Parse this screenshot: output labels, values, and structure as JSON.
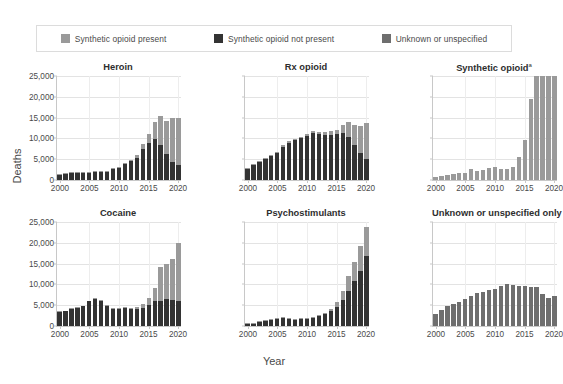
{
  "legend": {
    "items": [
      {
        "label": "Synthetic opioid present",
        "color": "#9a9a9a",
        "key": "present"
      },
      {
        "label": "Synthetic opioid not present",
        "color": "#333333",
        "key": "not_present"
      },
      {
        "label": "Unknown or unspecified",
        "color": "#6e6e6e",
        "key": "unknown"
      }
    ]
  },
  "axes": {
    "xlabel": "Year",
    "ylabel": "Deaths",
    "yticks": [
      "0",
      "5,000",
      "10,000",
      "15,000",
      "20,000",
      "25,000"
    ],
    "ytick_values": [
      0,
      5000,
      10000,
      15000,
      20000,
      25000
    ],
    "ylim": [
      0,
      25000
    ],
    "xticks": [
      "2000",
      "2005",
      "2010",
      "2015",
      "2020"
    ],
    "xtick_values": [
      2000,
      2005,
      2010,
      2015,
      2020
    ],
    "xlim": [
      2000,
      2020
    ]
  },
  "chart_data": {
    "type": "bar",
    "title": "",
    "xlabel": "Year",
    "ylabel": "Deaths",
    "ylim": [
      0,
      25000
    ],
    "grid": "horizontal-and-vertical",
    "legend_position": "top",
    "stacked": true,
    "x": [
      2000,
      2001,
      2002,
      2003,
      2004,
      2005,
      2006,
      2007,
      2008,
      2009,
      2010,
      2011,
      2012,
      2013,
      2014,
      2015,
      2016,
      2017,
      2018,
      2019,
      2020
    ],
    "panels": [
      {
        "title": "Heroin",
        "title_superscript": "",
        "series": [
          {
            "name": "Synthetic opioid not present",
            "key": "not_present",
            "color": "#333333",
            "values": [
              1300,
              1500,
              1700,
              1800,
              1700,
              1800,
              1900,
              1900,
              2000,
              2600,
              2800,
              3800,
              4500,
              5400,
              7400,
              9000,
              9800,
              8500,
              6200,
              4400,
              3500
            ]
          },
          {
            "name": "Synthetic opioid present",
            "key": "present",
            "color": "#9a9a9a",
            "values": [
              50,
              60,
              70,
              80,
              80,
              90,
              120,
              110,
              120,
              140,
              170,
              250,
              400,
              700,
              1200,
              2000,
              4200,
              7000,
              8000,
              10600,
              11300
            ]
          }
        ]
      },
      {
        "title": "Rx opioid",
        "title_superscript": "",
        "series": [
          {
            "name": "Synthetic opioid not present",
            "key": "not_present",
            "color": "#333333",
            "values": [
              2700,
              3600,
              4400,
              5100,
              5800,
              6400,
              8000,
              9000,
              9500,
              10000,
              10500,
              11200,
              11000,
              10800,
              10800,
              11000,
              11400,
              10400,
              8400,
              6400,
              5000
            ]
          },
          {
            "name": "Synthetic opioid present",
            "key": "present",
            "color": "#9a9a9a",
            "values": [
              100,
              130,
              160,
              200,
              230,
              260,
              320,
              340,
              360,
              400,
              450,
              520,
              600,
              700,
              900,
              1100,
              1900,
              3500,
              4800,
              6600,
              8800
            ]
          }
        ]
      },
      {
        "title": "Synthetic opioid",
        "title_superscript": "a",
        "series": [
          {
            "name": "Synthetic opioid present",
            "key": "present",
            "color": "#9a9a9a",
            "values": [
              730,
              950,
              1300,
              1400,
              1660,
              1740,
              2700,
              2210,
              2310,
              2950,
              3010,
              2670,
              2630,
              3110,
              5540,
              9580,
              19410,
              28470,
              31340,
              36360,
              56520
            ]
          }
        ]
      },
      {
        "title": "Cocaine",
        "title_superscript": "",
        "series": [
          {
            "name": "Synthetic opioid not present",
            "key": "not_present",
            "color": "#333333",
            "values": [
              3400,
              3500,
              4100,
              4400,
              4700,
              5900,
              6600,
              6000,
              4800,
              4200,
              4100,
              4300,
              4100,
              4100,
              4400,
              5000,
              5900,
              6100,
              6400,
              6200,
              6000
            ]
          },
          {
            "name": "Synthetic opioid present",
            "key": "present",
            "color": "#9a9a9a",
            "values": [
              60,
              70,
              90,
              100,
              120,
              140,
              180,
              160,
              150,
              150,
              160,
              200,
              300,
              500,
              900,
              1700,
              3200,
              8000,
              8400,
              9900,
              13900
            ]
          }
        ]
      },
      {
        "title": "Psychostimulants",
        "title_superscript": "",
        "series": [
          {
            "name": "Synthetic opioid not present",
            "key": "not_present",
            "color": "#333333",
            "values": [
              500,
              600,
              900,
              1200,
              1400,
              1800,
              1900,
              1600,
              1500,
              1600,
              1800,
              2000,
              2400,
              2800,
              3500,
              4600,
              6200,
              8400,
              10800,
              13200,
              16800
            ]
          },
          {
            "name": "Synthetic opioid present",
            "key": "present",
            "color": "#9a9a9a",
            "values": [
              30,
              40,
              50,
              60,
              70,
              90,
              110,
              100,
              100,
              110,
              130,
              170,
              250,
              400,
              700,
              1200,
              2200,
              3600,
              4600,
              6000,
              7000
            ]
          }
        ]
      },
      {
        "title": "Unknown or unspecified only",
        "title_superscript": "",
        "series": [
          {
            "name": "Unknown or unspecified",
            "key": "unknown",
            "color": "#6e6e6e",
            "values": [
              3000,
              3900,
              4700,
              5200,
              5700,
              6400,
              7300,
              7900,
              8200,
              8600,
              9000,
              9600,
              10200,
              9900,
              9700,
              9500,
              9300,
              9300,
              7800,
              6700,
              7300
            ]
          }
        ]
      }
    ]
  }
}
